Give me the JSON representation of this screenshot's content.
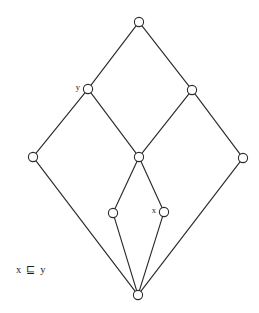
{
  "figure": {
    "kind": "hasse-diagram",
    "title": "",
    "caption": "x ⊑ y",
    "caption_x": 16,
    "caption_y": 271,
    "background_color": "#ffffff",
    "stroke_color": "#2b2b2b",
    "node_fill_color": "#ffffff",
    "node_radius": 4.6,
    "width": 259,
    "height": 313
  },
  "nodes": [
    {
      "id": "top",
      "label": "",
      "x": 139,
      "y": 22,
      "label_x": 131,
      "label_y": 22
    },
    {
      "id": "y",
      "label": "y",
      "x": 88,
      "y": 89,
      "label_x": 80,
      "label_y": 88
    },
    {
      "id": "ur",
      "label": "",
      "x": 192,
      "y": 90,
      "label_x": 184,
      "label_y": 90
    },
    {
      "id": "left",
      "label": "",
      "x": 33,
      "y": 157,
      "label_x": 25,
      "label_y": 157
    },
    {
      "id": "center",
      "label": "",
      "x": 139,
      "y": 157,
      "label_x": 131,
      "label_y": 157
    },
    {
      "id": "right",
      "label": "",
      "x": 243,
      "y": 158,
      "label_x": 235,
      "label_y": 158
    },
    {
      "id": "lowmid",
      "label": "",
      "x": 113,
      "y": 213,
      "label_x": 105,
      "label_y": 213
    },
    {
      "id": "x",
      "label": "x",
      "x": 164,
      "y": 212,
      "label_x": 156,
      "label_y": 211
    },
    {
      "id": "bottom",
      "label": "",
      "x": 138,
      "y": 295,
      "label_x": 130,
      "label_y": 295
    }
  ],
  "edges": [
    {
      "from": "top",
      "to": "y",
      "x1": 139,
      "y1": 22,
      "x2": 88,
      "y2": 89
    },
    {
      "from": "top",
      "to": "ur",
      "x1": 139,
      "y1": 22,
      "x2": 192,
      "y2": 90
    },
    {
      "from": "y",
      "to": "left",
      "x1": 88,
      "y1": 89,
      "x2": 33,
      "y2": 157
    },
    {
      "from": "y",
      "to": "center",
      "x1": 88,
      "y1": 89,
      "x2": 139,
      "y2": 157
    },
    {
      "from": "ur",
      "to": "center",
      "x1": 192,
      "y1": 90,
      "x2": 139,
      "y2": 157
    },
    {
      "from": "ur",
      "to": "right",
      "x1": 192,
      "y1": 90,
      "x2": 243,
      "y2": 158
    },
    {
      "from": "center",
      "to": "lowmid",
      "x1": 139,
      "y1": 157,
      "x2": 113,
      "y2": 213
    },
    {
      "from": "center",
      "to": "x",
      "x1": 139,
      "y1": 157,
      "x2": 164,
      "y2": 212
    },
    {
      "from": "left",
      "to": "bottom",
      "x1": 33,
      "y1": 157,
      "x2": 138,
      "y2": 295
    },
    {
      "from": "right",
      "to": "bottom",
      "x1": 243,
      "y1": 158,
      "x2": 138,
      "y2": 295
    },
    {
      "from": "lowmid",
      "to": "bottom",
      "x1": 113,
      "y1": 213,
      "x2": 138,
      "y2": 295
    },
    {
      "from": "x",
      "to": "bottom",
      "x1": 164,
      "y1": 212,
      "x2": 138,
      "y2": 295
    }
  ]
}
